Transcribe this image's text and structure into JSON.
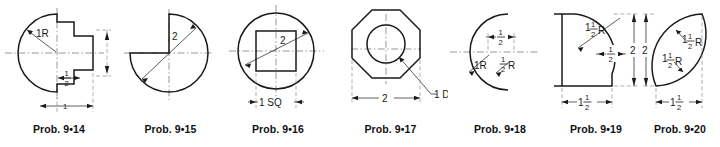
{
  "sheet": {
    "background_color": "#ffffff",
    "line_color": "#1a1a1a",
    "centerline_color": "#6b6b6b",
    "figure_count": 7
  },
  "figures": [
    {
      "id": "prob-9-14",
      "caption": "Prob. 9•14",
      "shape": "circle with stepped rectangular boss on right",
      "dimensions": [
        {
          "name": "radius",
          "text": "1R",
          "whole": "1",
          "suffix": "R"
        },
        {
          "name": "step-width",
          "text": "½",
          "numerator": "1",
          "denominator": "2"
        },
        {
          "name": "step-depth",
          "text": "1",
          "whole": "1"
        }
      ]
    },
    {
      "id": "prob-9-15",
      "caption": "Prob. 9•15",
      "shape": "circle with upper-left quadrant removed",
      "dimensions": [
        {
          "name": "diameter",
          "text": "2",
          "whole": "2"
        }
      ]
    },
    {
      "id": "prob-9-16",
      "caption": "Prob. 9•16",
      "shape": "circle with concentric square inside",
      "dimensions": [
        {
          "name": "diameter",
          "text": "2",
          "whole": "2"
        },
        {
          "name": "square-side",
          "text": "1 SQ",
          "whole": "1",
          "suffix": "SQ"
        }
      ]
    },
    {
      "id": "prob-9-17",
      "caption": "Prob. 9•17",
      "shape": "regular octagon with concentric circular hole",
      "dimensions": [
        {
          "name": "across-flats",
          "text": "2",
          "whole": "2"
        },
        {
          "name": "hole-diameter",
          "text": "1 DIA",
          "whole": "1",
          "suffix": "DIA"
        }
      ]
    },
    {
      "id": "prob-9-18",
      "caption": "Prob. 9•18",
      "shape": "crescent formed by two overlapping arcs",
      "dimensions": [
        {
          "name": "outer-radius",
          "text": "1R",
          "whole": "1",
          "suffix": "R"
        },
        {
          "name": "offset",
          "text": "½",
          "numerator": "1",
          "denominator": "2"
        },
        {
          "name": "inner-radius",
          "text": "½R",
          "numerator": "1",
          "denominator": "2",
          "suffix": "R"
        }
      ]
    },
    {
      "id": "prob-9-19",
      "caption": "Prob. 9•19",
      "shape": "rectangular block with large concave fillet cut from upper right",
      "dimensions": [
        {
          "name": "fillet-radius",
          "text": "1½R",
          "whole": "1",
          "numerator": "1",
          "denominator": "2",
          "suffix": "R"
        },
        {
          "name": "flat-width",
          "text": "½",
          "numerator": "1",
          "denominator": "2"
        },
        {
          "name": "height",
          "text": "2",
          "whole": "2"
        },
        {
          "name": "width",
          "text": "1½",
          "whole": "1",
          "numerator": "1",
          "denominator": "2"
        }
      ]
    },
    {
      "id": "prob-9-20",
      "caption": "Prob. 9•20",
      "shape": "lens (vesica) formed by two equal arcs",
      "dimensions": [
        {
          "name": "upper-arc-radius",
          "text": "1½R",
          "whole": "1",
          "numerator": "1",
          "denominator": "2",
          "suffix": "R"
        },
        {
          "name": "lower-arc-radius",
          "text": "1½R",
          "whole": "1",
          "numerator": "1",
          "denominator": "2",
          "suffix": "R"
        },
        {
          "name": "height",
          "text": "2",
          "whole": "2"
        },
        {
          "name": "width",
          "text": "1½",
          "whole": "1",
          "numerator": "1",
          "denominator": "2"
        }
      ]
    }
  ]
}
